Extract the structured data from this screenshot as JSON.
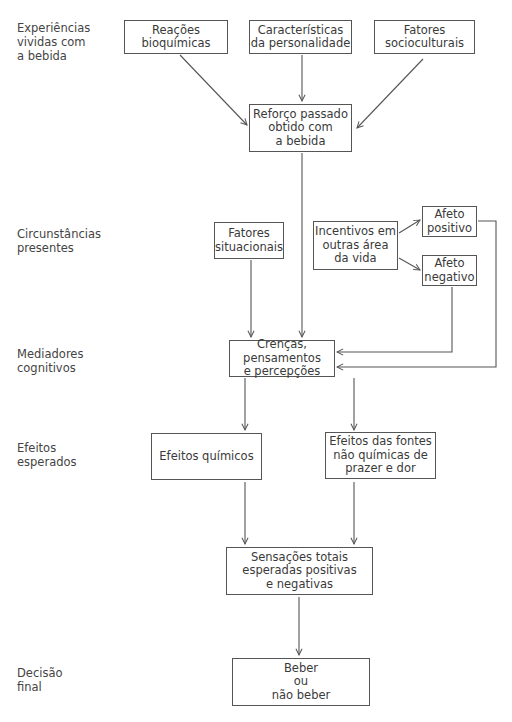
{
  "diagram": {
    "stages": [
      {
        "id": "experiencias",
        "label": "Experiências\nvividas com\na bebida"
      },
      {
        "id": "circunstancias",
        "label": "Circunstâncias\npresentes"
      },
      {
        "id": "mediadores",
        "label": "Mediadores\ncognitivos"
      },
      {
        "id": "efeitos",
        "label": "Efeitos\nesperados"
      },
      {
        "id": "decisao",
        "label": "Decisão\nfinal"
      }
    ],
    "nodes": {
      "reacoes": "Reações\nbioquímicas",
      "personalidade": "Características\nda personalidade",
      "socioculturais": "Fatores\nsocioculturais",
      "reforco": "Reforço passado\nobtido com\na bebida",
      "situacionais": "Fatores\nsituacionais",
      "incentivos": "Incentivos em\noutras área\nda vida",
      "afeto_positivo": "Afeto\npositivo",
      "afeto_negativo": "Afeto\nnegativo",
      "crencas": "Crenças, pensamentos\ne percepções",
      "quimicos": "Efeitos químicos",
      "nao_quimicos": "Efeitos das fontes\nnão químicas de\nprazer e dor",
      "sensacoes": "Sensações totais\nesperadas positivas\ne negativas",
      "decisao": "Beber\nou\nnão beber"
    },
    "edges": [
      [
        "reacoes",
        "reforco"
      ],
      [
        "personalidade",
        "reforco"
      ],
      [
        "socioculturais",
        "reforco"
      ],
      [
        "reforco",
        "crencas"
      ],
      [
        "situacionais",
        "crencas"
      ],
      [
        "incentivos",
        "afeto_positivo"
      ],
      [
        "incentivos",
        "afeto_negativo"
      ],
      [
        "afeto_negativo",
        "crencas"
      ],
      [
        "afeto_positivo",
        "crencas"
      ],
      [
        "crencas",
        "quimicos"
      ],
      [
        "crencas",
        "nao_quimicos"
      ],
      [
        "quimicos",
        "sensacoes"
      ],
      [
        "nao_quimicos",
        "sensacoes"
      ],
      [
        "sensacoes",
        "decisao"
      ]
    ],
    "colors": {
      "line": "#555555",
      "text": "#3a3a3a",
      "background": "#ffffff"
    }
  }
}
